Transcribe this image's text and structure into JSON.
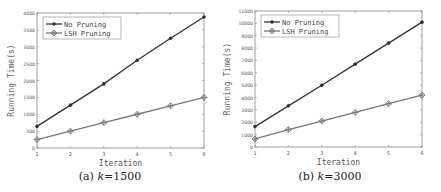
{
  "chart_data": [
    {
      "type": "line",
      "title": "",
      "caption_prefix": "(a) ",
      "caption_var": "k",
      "caption_value": "=1500",
      "xlabel": "Iteration",
      "ylabel": "Running Time(s)",
      "x": [
        1,
        2,
        3,
        4,
        5,
        6
      ],
      "xlim": [
        1,
        6
      ],
      "ylim": [
        0,
        4000
      ],
      "yticks": [
        0,
        500,
        1000,
        1500,
        2000,
        2500,
        3000,
        3500,
        4000
      ],
      "grid": false,
      "legend_position": "upper left",
      "series": [
        {
          "name": "No Pruning",
          "marker": "dot",
          "color": "#333333",
          "values": [
            640,
            1270,
            1900,
            2600,
            3250,
            3880
          ]
        },
        {
          "name": "LSH Pruning",
          "marker": "diamond-plus",
          "color": "#777777",
          "values": [
            250,
            500,
            750,
            1000,
            1250,
            1500
          ]
        }
      ]
    },
    {
      "type": "line",
      "title": "",
      "caption_prefix": "(b) ",
      "caption_var": "k",
      "caption_value": "=3000",
      "xlabel": "Iteration",
      "ylabel": "Running Time(s)",
      "x": [
        1,
        2,
        3,
        4,
        5,
        6
      ],
      "xlim": [
        1,
        6
      ],
      "ylim": [
        0,
        11000
      ],
      "yticks": [
        0,
        1000,
        2000,
        3000,
        4000,
        5000,
        6000,
        7000,
        8000,
        9000,
        10000,
        11000
      ],
      "grid": false,
      "legend_position": "upper left",
      "series": [
        {
          "name": "No Pruning",
          "marker": "dot",
          "color": "#333333",
          "values": [
            1650,
            3330,
            5000,
            6700,
            8400,
            10100
          ]
        },
        {
          "name": "LSH Pruning",
          "marker": "diamond-plus",
          "color": "#777777",
          "values": [
            650,
            1400,
            2100,
            2800,
            3500,
            4200
          ]
        }
      ]
    }
  ]
}
